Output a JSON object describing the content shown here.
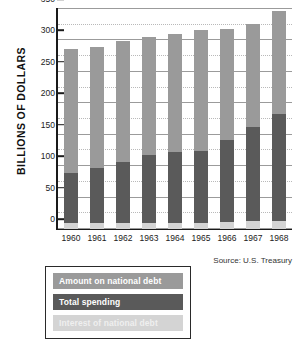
{
  "chart_data": {
    "type": "bar",
    "stacked": true,
    "title": "",
    "subtitle": "",
    "xlabel": "",
    "ylabel": "BILLIONS OF DOLLARS",
    "categories": [
      "1960",
      "1961",
      "1962",
      "1963",
      "1964",
      "1965",
      "1966",
      "1967",
      "1968"
    ],
    "ylim": [
      0,
      350
    ],
    "yticks": [
      0,
      50,
      100,
      150,
      200,
      250,
      300,
      350
    ],
    "ytick_labels": [
      "0",
      "50",
      "100",
      "150",
      "200",
      "250",
      "300",
      "350"
    ],
    "minor_gridlines": true,
    "grid": true,
    "legend_position": "below-left",
    "series": [
      {
        "name": "Interest of national debt",
        "color": "#d4d4d4",
        "values": [
          9,
          9,
          9,
          9,
          10,
          10,
          11,
          12,
          13
        ]
      },
      {
        "name": "Total spending",
        "color": "#5a5a5a",
        "values": [
          80,
          88,
          97,
          108,
          112,
          114,
          130,
          151,
          170
        ]
      },
      {
        "name": "Amount on national debt",
        "color": "#9a9a9a",
        "values": [
          197,
          192,
          193,
          189,
          189,
          193,
          178,
          163,
          164
        ]
      }
    ],
    "segment_tops": {
      "interest": [
        9,
        9,
        9,
        9,
        10,
        10,
        11,
        12,
        13
      ],
      "total_spending": [
        89,
        97,
        106,
        117,
        122,
        124,
        141,
        163,
        183
      ],
      "total": [
        286,
        289,
        299,
        306,
        311,
        317,
        319,
        326,
        347
      ]
    },
    "annotations": [
      "Source: U.S. Treasury"
    ]
  },
  "axis": {
    "y_title": "BILLIONS OF DOLLARS"
  },
  "legend": {
    "items": [
      {
        "label": "Amount on national debt",
        "color": "#9a9a9a"
      },
      {
        "label": "Total spending",
        "color": "#5a5a5a"
      },
      {
        "label": "Interest of national debt",
        "color": "#d4d4d4"
      }
    ]
  },
  "source": {
    "text": "Source: U.S. Treasury"
  }
}
